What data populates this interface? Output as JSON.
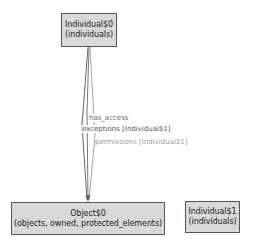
{
  "diagram": {
    "nodes": [
      {
        "id": "individual0",
        "name": "Individual$0",
        "subtitle": "(individuals)"
      },
      {
        "id": "object0",
        "name": "Object$0",
        "subtitle": "(objects, owned, protected_elements)"
      },
      {
        "id": "individual1",
        "name": "Individual$1",
        "subtitle": "(individuals)"
      }
    ],
    "edges": [
      {
        "from": "individual0",
        "to": "object0",
        "label": "has_access",
        "color": "#6a6a6a"
      },
      {
        "from": "individual0",
        "to": "object0",
        "label": "exceptions [Individual$1]",
        "color": "#555555"
      },
      {
        "from": "individual0",
        "to": "object0",
        "label": "permissions [Individual$1]",
        "color": "#9a9a9a"
      }
    ]
  },
  "colors": {
    "node_fill": "#d9d9d9",
    "node_border": "#555555",
    "background": "#ffffff"
  }
}
